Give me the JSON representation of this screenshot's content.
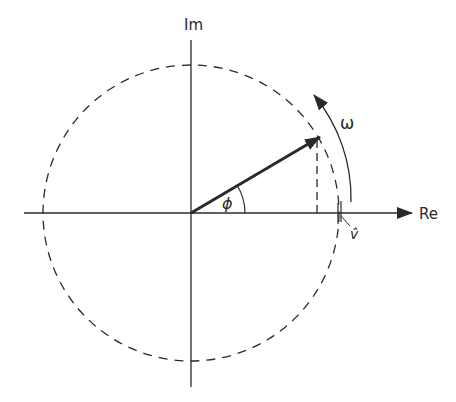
{
  "diagram": {
    "labels": {
      "imaginary_axis": "Im",
      "real_axis": "Re",
      "angle": "ϕ",
      "angular_velocity": "ω",
      "amplitude": "v̂"
    },
    "colors": {
      "stroke": "#2a2a2a",
      "background": "#ffffff"
    }
  }
}
